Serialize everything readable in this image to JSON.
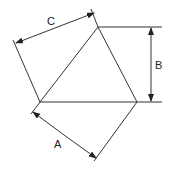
{
  "diagram": {
    "labels": {
      "a": "A",
      "b": "B",
      "c": "C"
    },
    "colors": {
      "line": "#333333",
      "background": "#ffffff"
    }
  }
}
